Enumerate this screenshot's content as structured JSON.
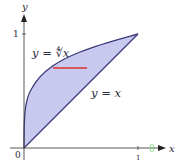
{
  "figure": {
    "curves": [
      {
        "label": "y = ∜x",
        "equation": "y = x^(1/4)",
        "display": "y = ∜x"
      },
      {
        "label": "y = x",
        "equation": "y = x",
        "display": "y = x"
      }
    ],
    "axes": {
      "x_label": "x",
      "y_label": "y",
      "origin_label": "0",
      "x_tick": "1",
      "y_tick": "1"
    },
    "region": {
      "description": "area between y = x^(1/4) and y = x for 0 ≤ x ≤ 1",
      "fill": "#c9c9f0",
      "stroke": "#3a3a7a"
    },
    "strip": {
      "description": "horizontal red strip",
      "color": "#e03030"
    },
    "marker": {
      "color": "#7ccf7c"
    }
  }
}
